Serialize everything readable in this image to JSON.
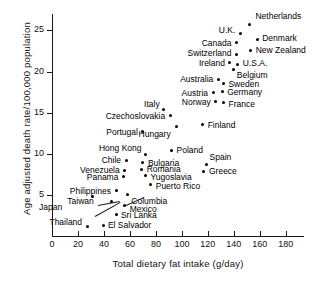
{
  "chart_data": {
    "type": "scatter",
    "title": "",
    "xlabel": "Total dietary fat intake (g/day)",
    "ylabel": "Age adjusted death rate/100,000 population",
    "xlim": [
      0,
      194
    ],
    "ylim": [
      0,
      27
    ],
    "xticks": [
      0,
      20,
      40,
      60,
      80,
      100,
      120,
      140,
      160,
      180
    ],
    "yticks": [
      5,
      10,
      15,
      20,
      25
    ],
    "grid": false,
    "legend": null,
    "points": [
      {
        "label": "Netherlands",
        "x": 152,
        "y": 25.7,
        "side": "l",
        "dx": 6,
        "dy": -9
      },
      {
        "label": "U.K.",
        "x": 145,
        "y": 24.6,
        "side": "r",
        "dx": -5,
        "dy": -4
      },
      {
        "label": "Denmark",
        "x": 158,
        "y": 23.9,
        "side": "l",
        "dx": 5,
        "dy": -1
      },
      {
        "label": "Canada",
        "x": 142,
        "y": 23.5,
        "side": "r",
        "dx": -5,
        "dy": 0
      },
      {
        "label": "New Zealand",
        "x": 153,
        "y": 22.6,
        "side": "l",
        "dx": 5,
        "dy": 0
      },
      {
        "label": "Switzerland",
        "x": 142,
        "y": 22.1,
        "side": "r",
        "dx": -5,
        "dy": -1
      },
      {
        "label": "Ireland",
        "x": 137,
        "y": 21.1,
        "side": "r",
        "dx": -5,
        "dy": 0
      },
      {
        "label": "U.S.A.",
        "x": 143,
        "y": 20.9,
        "side": "l",
        "dx": 5,
        "dy": -1
      },
      {
        "label": "Belgium",
        "x": 140,
        "y": 20.2,
        "side": "l",
        "dx": 3,
        "dy": 5
      },
      {
        "label": "Australia",
        "x": 128,
        "y": 19.0,
        "side": "r",
        "dx": -5,
        "dy": -1
      },
      {
        "label": "Sweden",
        "x": 132,
        "y": 18.5,
        "side": "l",
        "dx": 5,
        "dy": 0
      },
      {
        "label": "Austria",
        "x": 124,
        "y": 17.4,
        "side": "r",
        "dx": -5,
        "dy": 0
      },
      {
        "label": "Germany",
        "x": 131,
        "y": 17.6,
        "side": "l",
        "dx": 5,
        "dy": 1
      },
      {
        "label": "Norway",
        "x": 126,
        "y": 16.3,
        "side": "r",
        "dx": -5,
        "dy": 0
      },
      {
        "label": "France",
        "x": 132,
        "y": 16.2,
        "side": "l",
        "dx": 5,
        "dy": 1
      },
      {
        "label": "Italy",
        "x": 86,
        "y": 15.4,
        "side": "r",
        "dx": -4,
        "dy": -5
      },
      {
        "label": "Czechoslovakia",
        "x": 91,
        "y": 14.6,
        "side": "r",
        "dx": -5,
        "dy": 0
      },
      {
        "label": "Finland",
        "x": 116,
        "y": 13.6,
        "side": "l",
        "dx": 5,
        "dy": 1
      },
      {
        "label": "Hungary",
        "x": 96,
        "y": 13.3,
        "side": "r",
        "dx": -6,
        "dy": 7
      },
      {
        "label": "Portugal",
        "x": 70,
        "y": 12.7,
        "side": "r",
        "dx": -5,
        "dy": 0
      },
      {
        "label": "Poland",
        "x": 92,
        "y": 10.4,
        "side": "l",
        "dx": 5,
        "dy": 0
      },
      {
        "label": "Hong Kong",
        "x": 72,
        "y": 9.9,
        "side": "r",
        "dx": -4,
        "dy": -7
      },
      {
        "label": "Spain",
        "x": 119,
        "y": 8.7,
        "side": "l",
        "dx": 3,
        "dy": -7
      },
      {
        "label": "Chile",
        "x": 57,
        "y": 9.2,
        "side": "r",
        "dx": -5,
        "dy": 0
      },
      {
        "label": "Bulgaria",
        "x": 70,
        "y": 8.9,
        "side": "l",
        "dx": 5,
        "dy": 0
      },
      {
        "label": "Venezuela",
        "x": 56,
        "y": 8.0,
        "side": "r",
        "dx": -5,
        "dy": 0
      },
      {
        "label": "Romania",
        "x": 69,
        "y": 8.1,
        "side": "l",
        "dx": 5,
        "dy": 0
      },
      {
        "label": "Greece",
        "x": 117,
        "y": 7.9,
        "side": "l",
        "dx": 5,
        "dy": 0
      },
      {
        "label": "Panama",
        "x": 55,
        "y": 7.2,
        "side": "r",
        "dx": -5,
        "dy": 0
      },
      {
        "label": "Yugoslavia",
        "x": 72,
        "y": 7.3,
        "side": "l",
        "dx": 5,
        "dy": 1
      },
      {
        "label": "Puerto Rico",
        "x": 76,
        "y": 6.3,
        "side": "l",
        "dx": 5,
        "dy": 2
      },
      {
        "label": "Philippines",
        "x": 50,
        "y": 5.5,
        "side": "r",
        "dx": -6,
        "dy": 0
      },
      {
        "label": "Columbia",
        "x": 58,
        "y": 5.0,
        "side": "l",
        "dx": 4,
        "dy": 6
      },
      {
        "label": "Taiwan",
        "x": 46,
        "y": 4.2,
        "side": "r",
        "dx": -18,
        "dy": 0
      },
      {
        "label": "Japan",
        "x": 31,
        "y": 4.8,
        "side": "r",
        "dx": -30,
        "dy": 10
      },
      {
        "label": "Mexico",
        "x": 56,
        "y": 3.7,
        "side": "l",
        "dx": 5,
        "dy": 3
      },
      {
        "label": "Sri Lanka",
        "x": 50,
        "y": 2.6,
        "side": "l",
        "dx": 4,
        "dy": 0
      },
      {
        "label": "Thailand",
        "x": 27,
        "y": 1.2,
        "side": "r",
        "dx": -5,
        "dy": -4
      },
      {
        "label": "El Salvador",
        "x": 40,
        "y": 1.3,
        "side": "l",
        "dx": 4,
        "dy": 0
      }
    ],
    "leaders": [
      {
        "name": "taiwan-leader",
        "x1": 98,
        "y1": 205,
        "x2": 120,
        "y2": 201
      },
      {
        "name": "japan-leader",
        "x1": 95,
        "y1": 216,
        "x2": 120,
        "y2": 202
      },
      {
        "name": "columbia-leader",
        "x1": 126,
        "y1": 205,
        "x2": 144,
        "y2": 197
      }
    ]
  }
}
